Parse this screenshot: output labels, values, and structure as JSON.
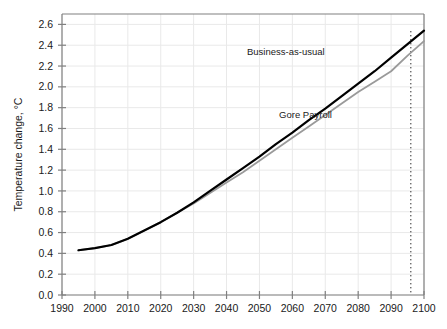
{
  "chart_data": {
    "type": "line",
    "title": "",
    "xlabel": "",
    "ylabel": "Temperature change, °C",
    "xlim": [
      1990,
      2100
    ],
    "ylim": [
      0.0,
      2.7
    ],
    "grid": true,
    "legend_position": "inline-annotation",
    "xticks": [
      "1990",
      "2000",
      "2010",
      "2020",
      "2030",
      "2040",
      "2050",
      "2060",
      "2070",
      "2080",
      "2090",
      "2100"
    ],
    "yticks": [
      "0.0",
      "0.2",
      "0.4",
      "0.6",
      "0.8",
      "1.0",
      "1.2",
      "1.4",
      "1.6",
      "1.8",
      "2.0",
      "2.2",
      "2.4",
      "2.6"
    ],
    "x": [
      1995,
      2000,
      2005,
      2010,
      2015,
      2020,
      2025,
      2030,
      2035,
      2040,
      2045,
      2050,
      2055,
      2060,
      2065,
      2070,
      2075,
      2080,
      2085,
      2090,
      2095,
      2100
    ],
    "series": [
      {
        "name": "Business-as-usual",
        "color": "#000000",
        "width": 2.2,
        "values": [
          0.43,
          0.45,
          0.48,
          0.54,
          0.62,
          0.7,
          0.79,
          0.89,
          1.0,
          1.11,
          1.22,
          1.33,
          1.45,
          1.56,
          1.68,
          1.79,
          1.91,
          2.03,
          2.15,
          2.28,
          2.41,
          2.54
        ]
      },
      {
        "name": "Gore Payroll",
        "color": "#9a9a9a",
        "width": 1.8,
        "values": [
          0.43,
          0.45,
          0.48,
          0.54,
          0.62,
          0.7,
          0.79,
          0.88,
          0.98,
          1.08,
          1.18,
          1.29,
          1.4,
          1.51,
          1.62,
          1.73,
          1.84,
          1.95,
          2.05,
          2.15,
          2.3,
          2.44
        ]
      }
    ],
    "annotations": [
      {
        "text": "Business-as-usual",
        "x": 2058,
        "y": 2.31
      },
      {
        "text": "Gore Payroll",
        "x": 2064,
        "y": 1.7
      }
    ],
    "markers": [
      {
        "type": "vertical-dotted-line",
        "x": 2096,
        "color": "#2b2b2b"
      }
    ],
    "colors": {
      "axis": "#808080",
      "grid": "#e9e9e9",
      "text": "#1a1a1a",
      "background": "#ffffff"
    }
  }
}
